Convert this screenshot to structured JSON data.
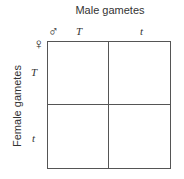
{
  "title_male": "Male gametes",
  "title_female": "Female gametes",
  "symbols": {
    "male": "♂",
    "female": "♀"
  },
  "male_alleles": [
    "T",
    "t"
  ],
  "female_alleles": [
    "T",
    "t"
  ],
  "cells": [
    [
      "",
      ""
    ],
    [
      "",
      ""
    ]
  ]
}
